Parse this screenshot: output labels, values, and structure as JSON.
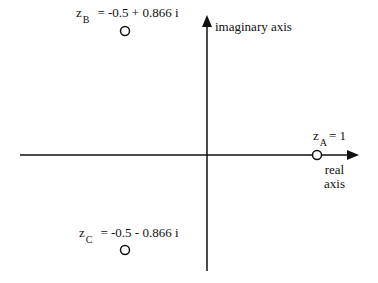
{
  "diagram": {
    "type": "complex-plane",
    "axes": {
      "horizontal": {
        "label_line1": "real",
        "label_line2": "axis"
      },
      "vertical": {
        "label": "imaginary axis"
      }
    },
    "points": [
      {
        "id": "A",
        "var": "z",
        "sub": "A",
        "value": "= 1"
      },
      {
        "id": "B",
        "var": "z",
        "sub": "B",
        "value": "= -0.5 + 0.866 i"
      },
      {
        "id": "C",
        "var": "z",
        "sub": "C",
        "value": "= -0.5 - 0.866 i"
      }
    ],
    "colors": {
      "stroke": "#111111",
      "background": "#ffffff"
    }
  }
}
